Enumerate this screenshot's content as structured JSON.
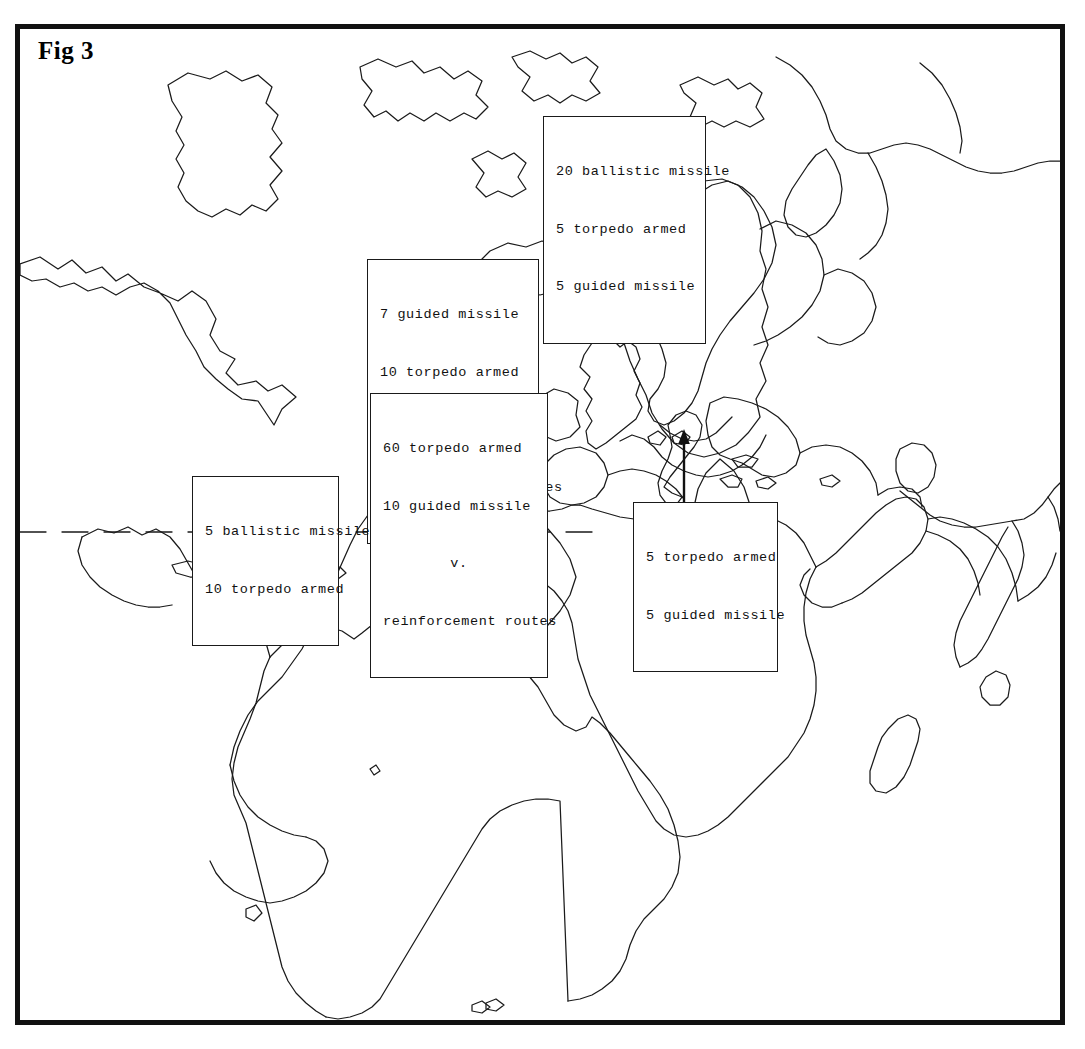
{
  "figure": {
    "label": "Fig 3",
    "border_color": "#111111",
    "background_color": "#ffffff",
    "coastline_color": "#1a1a1a"
  },
  "callouts": [
    {
      "id": "nordic-gap",
      "name": "callout-norwegian-sea",
      "lines": [
        {
          "text": "20 ballistic missile",
          "align": "left"
        },
        {
          "text": "5 torpedo armed",
          "align": "left"
        },
        {
          "text": "5 guided missile",
          "align": "left"
        }
      ]
    },
    {
      "id": "giuk-gap",
      "name": "callout-carrier-strike-forces",
      "lines": [
        {
          "text": "7 guided missile",
          "align": "left"
        },
        {
          "text": "10 torpedo armed",
          "align": "left"
        },
        {
          "text": "v.",
          "align": "center"
        },
        {
          "text": "carrier strike forces",
          "align": "left"
        }
      ]
    },
    {
      "id": "reinforcement",
      "name": "callout-reinforcement-routes",
      "lines": [
        {
          "text": "60 torpedo armed",
          "align": "left"
        },
        {
          "text": "10 guided missile",
          "align": "left"
        },
        {
          "text": "v.",
          "align": "center"
        },
        {
          "text": "reinforcement routes",
          "align": "left"
        }
      ]
    },
    {
      "id": "caribbean",
      "name": "callout-caribbean",
      "lines": [
        {
          "text": "5 ballistic missile",
          "align": "left"
        },
        {
          "text": "10 torpedo armed",
          "align": "left"
        }
      ]
    },
    {
      "id": "mediterranean",
      "name": "callout-mediterranean",
      "lines": [
        {
          "text": "5 torpedo armed",
          "align": "left"
        },
        {
          "text": "5 guided missile",
          "align": "left"
        }
      ]
    }
  ],
  "annotations": {
    "arrow": {
      "name": "mediterranean-arrow",
      "description": "arrow pointing north from mediterranean callout into the sea"
    },
    "dashed_line": {
      "name": "latitude-dashed-line",
      "description": "horizontal dashed latitude line across the atlantic"
    }
  }
}
